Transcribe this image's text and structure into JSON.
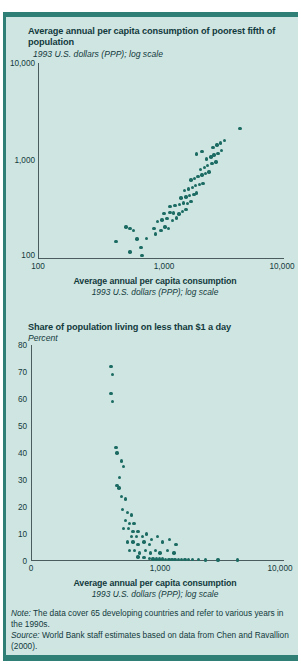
{
  "page": {
    "cropped_heading": "",
    "accent_color": "#2f7f76",
    "panel_color": "#cfe5e2",
    "dot_color": "#1b6b63"
  },
  "chart_data": [
    {
      "type": "scatter",
      "title": "Average annual per capita consumption of poorest fifth of population",
      "subtitle": "1993 U.S. dollars (PPP); log scale",
      "xlabel": "Average annual per capita consumption",
      "xsublabel": "1993 U.S. dollars (PPP); log scale",
      "ylabel": "",
      "xscale": "log",
      "yscale": "log",
      "xlim": [
        100,
        10000
      ],
      "ylim": [
        100,
        10000
      ],
      "xticks": [
        "100",
        "1,000",
        "10,000"
      ],
      "yticks": [
        "100",
        "1,000",
        "10,000"
      ],
      "grid": false,
      "legend": null,
      "points": [
        [
          560,
          118
        ],
        [
          700,
          108
        ],
        [
          690,
          131
        ],
        [
          430,
          150
        ],
        [
          640,
          160
        ],
        [
          760,
          163
        ],
        [
          600,
          196
        ],
        [
          560,
          205
        ],
        [
          520,
          212
        ],
        [
          900,
          180
        ],
        [
          880,
          205
        ],
        [
          1000,
          196
        ],
        [
          1080,
          213
        ],
        [
          1150,
          205
        ],
        [
          940,
          243
        ],
        [
          1020,
          250
        ],
        [
          1120,
          258
        ],
        [
          1240,
          247
        ],
        [
          1330,
          262
        ],
        [
          1060,
          290
        ],
        [
          1180,
          300
        ],
        [
          1260,
          296
        ],
        [
          1400,
          289
        ],
        [
          1500,
          305
        ],
        [
          1600,
          318
        ],
        [
          1180,
          345
        ],
        [
          1300,
          352
        ],
        [
          1420,
          360
        ],
        [
          1520,
          372
        ],
        [
          1650,
          368
        ],
        [
          1750,
          385
        ],
        [
          1450,
          420
        ],
        [
          1600,
          430
        ],
        [
          1700,
          445
        ],
        [
          1850,
          455
        ],
        [
          1950,
          470
        ],
        [
          1560,
          500
        ],
        [
          1680,
          520
        ],
        [
          1800,
          540
        ],
        [
          1900,
          560
        ],
        [
          2050,
          575
        ],
        [
          2200,
          590
        ],
        [
          1750,
          640
        ],
        [
          1880,
          660
        ],
        [
          2000,
          690
        ],
        [
          2150,
          720
        ],
        [
          2300,
          745
        ],
        [
          2450,
          770
        ],
        [
          2100,
          820
        ],
        [
          2250,
          860
        ],
        [
          2400,
          900
        ],
        [
          2600,
          940
        ],
        [
          2800,
          980
        ],
        [
          2350,
          1050
        ],
        [
          2550,
          1100
        ],
        [
          2700,
          1150
        ],
        [
          2900,
          1200
        ],
        [
          3100,
          1280
        ],
        [
          2650,
          1380
        ],
        [
          2850,
          1450
        ],
        [
          3050,
          1520
        ],
        [
          3300,
          1620
        ],
        [
          4400,
          2150
        ],
        [
          2150,
          1250
        ],
        [
          1950,
          1180
        ]
      ]
    },
    {
      "type": "scatter",
      "title": "Share of population living on less than $1 a day",
      "subtitle": "Percent",
      "xlabel": "Average annual per capita consumption",
      "xsublabel": "1993 U.S. dollars (PPP); log scale",
      "ylabel": "Percent",
      "xscale": "log",
      "yscale": "linear",
      "xlim": [
        100,
        10000
      ],
      "ylim": [
        0,
        80
      ],
      "xticks": [
        "0",
        "1,000",
        "10,000"
      ],
      "yticks": [
        "0",
        "10",
        "20",
        "30",
        "40",
        "50",
        "60",
        "70",
        "80"
      ],
      "grid": false,
      "legend": null,
      "points": [
        [
          430,
          72
        ],
        [
          440,
          69
        ],
        [
          430,
          62
        ],
        [
          440,
          59
        ],
        [
          470,
          42
        ],
        [
          480,
          40
        ],
        [
          520,
          37
        ],
        [
          540,
          35
        ],
        [
          500,
          31
        ],
        [
          480,
          28
        ],
        [
          495,
          27
        ],
        [
          520,
          24
        ],
        [
          560,
          23
        ],
        [
          530,
          19
        ],
        [
          580,
          18
        ],
        [
          620,
          17
        ],
        [
          560,
          15
        ],
        [
          600,
          14
        ],
        [
          650,
          14
        ],
        [
          540,
          12
        ],
        [
          590,
          12
        ],
        [
          640,
          11
        ],
        [
          700,
          11
        ],
        [
          620,
          9
        ],
        [
          680,
          9
        ],
        [
          760,
          9
        ],
        [
          820,
          10
        ],
        [
          580,
          7
        ],
        [
          640,
          7
        ],
        [
          700,
          6
        ],
        [
          780,
          7
        ],
        [
          860,
          6
        ],
        [
          900,
          8
        ],
        [
          1000,
          9
        ],
        [
          1100,
          7
        ],
        [
          1250,
          8
        ],
        [
          1400,
          6
        ],
        [
          600,
          4
        ],
        [
          660,
          4
        ],
        [
          720,
          3
        ],
        [
          800,
          4
        ],
        [
          880,
          3
        ],
        [
          960,
          4
        ],
        [
          1050,
          3
        ],
        [
          1200,
          4
        ],
        [
          1350,
          3
        ],
        [
          700,
          1.5
        ],
        [
          780,
          1.2
        ],
        [
          860,
          1.0
        ],
        [
          920,
          0.8
        ],
        [
          980,
          0.8
        ],
        [
          1040,
          0.7
        ],
        [
          1100,
          0.7
        ],
        [
          1160,
          0.6
        ],
        [
          1230,
          0.6
        ],
        [
          1300,
          0.6
        ],
        [
          1380,
          0.5
        ],
        [
          1460,
          0.5
        ],
        [
          1550,
          0.5
        ],
        [
          1650,
          0.5
        ],
        [
          1760,
          0.5
        ],
        [
          1900,
          0.5
        ],
        [
          2100,
          0.5
        ],
        [
          2400,
          0.4
        ],
        [
          3000,
          0.4
        ],
        [
          4300,
          0.4
        ]
      ]
    }
  ],
  "footnotes": {
    "note_label": "Note:",
    "note_text": " The data cover 65 developing countries and refer to various years in the 1990s.",
    "source_label": "Source:",
    "source_text": " World Bank staff estimates based on data from Chen and Ravallion (2000)."
  }
}
